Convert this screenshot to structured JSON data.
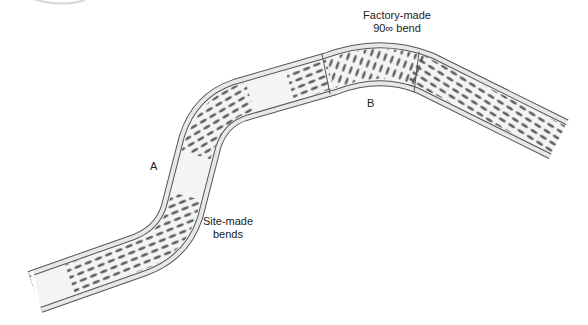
{
  "diagram": {
    "labels": {
      "factory_bend_line1": "Factory-made",
      "factory_bend_line2": "90∞ bend",
      "site_bends_line1": "Site-made",
      "site_bends_line2": "bends",
      "point_a": "A",
      "point_b": "B"
    },
    "colors": {
      "tray_fill": "#f2f2f2",
      "tray_edge": "#555555",
      "rim_fill": "#e6e6e6",
      "perforation": "#555555",
      "background": "#ffffff"
    }
  }
}
